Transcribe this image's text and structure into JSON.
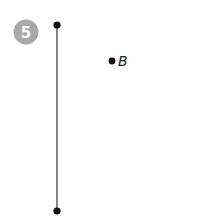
{
  "step": {
    "number": "5",
    "badge_color": "#a8a8a8"
  },
  "segment": {
    "color": "#666666",
    "top_endpoint": {
      "x": 57,
      "y": 25
    },
    "bottom_endpoint": {
      "x": 57,
      "y": 211
    }
  },
  "points": [
    {
      "label": "B",
      "x": 112,
      "y": 61
    }
  ]
}
